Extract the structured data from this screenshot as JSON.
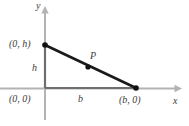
{
  "figure": {
    "type": "geometry-diagram",
    "width": 189,
    "height": 126,
    "background_color": "#ffffff"
  },
  "axes": {
    "x_axis_label": "x",
    "y_axis_label": "y",
    "axis_color": "#b3b3b3",
    "origin_px": {
      "x": 45,
      "y": 88
    },
    "x_axis_y_px": 88,
    "y_axis_x_px": 45,
    "x_axis_start_px": 0,
    "x_axis_end_px": 181,
    "y_axis_top_px": 8,
    "y_axis_bottom_px": 120
  },
  "triangle": {
    "leg_color": "#6e6e6e",
    "hypotenuse_color": "#1a1a1a",
    "vertices": [
      {
        "name": "top-vertex",
        "label": "(0, h)",
        "px": {
          "x": 45,
          "y": 45
        }
      },
      {
        "name": "origin-vertex",
        "label": "(0, 0)",
        "px": {
          "x": 45,
          "y": 88
        }
      },
      {
        "name": "right-vertex",
        "label": "(b, 0)",
        "px": {
          "x": 136,
          "y": 88
        }
      }
    ]
  },
  "points": [
    {
      "name": "point-top",
      "label": "(0, h)",
      "px": {
        "x": 45,
        "y": 45
      },
      "marker": "filled-dot"
    },
    {
      "name": "point-right",
      "label": "(b, 0)",
      "px": {
        "x": 136,
        "y": 88
      },
      "marker": "filled-dot"
    },
    {
      "name": "point-p",
      "label": "P",
      "px": {
        "x": 88,
        "y": 67
      },
      "marker": "filled-dot"
    }
  ],
  "labels": {
    "y_axis": "y",
    "x_axis": "x",
    "vertex_top": "(0, h)",
    "height_leg": "h",
    "vertex_origin": "(0, 0)",
    "base_leg": "b",
    "vertex_right": "(b, 0)",
    "point_p": "P"
  },
  "colors": {
    "background": "#ffffff",
    "axis": "#b3b3b3",
    "leg": "#6e6e6e",
    "hypotenuse": "#1a1a1a",
    "text": "#3b3b3b",
    "dot": "#111111"
  }
}
